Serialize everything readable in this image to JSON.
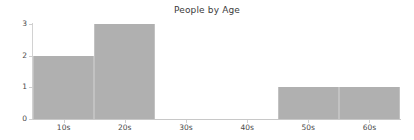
{
  "chart_data": {
    "type": "bar",
    "title": "People by Age",
    "xlabel": "",
    "ylabel": "",
    "categories": [
      "10s",
      "20s",
      "30s",
      "40s",
      "50s",
      "60s"
    ],
    "values": [
      2,
      3,
      0,
      0,
      1,
      1
    ],
    "ytick_labels": [
      "0",
      "1",
      "2",
      "3"
    ],
    "ytick_values": [
      0,
      1,
      2,
      3
    ],
    "ylim": [
      0,
      3
    ],
    "grid": false,
    "legend": null,
    "bar_style": "contiguous-histogram",
    "colors": {
      "bar_fill": "#b0b0b0",
      "bar_edge": "#c2c2c2",
      "axis": "#c8c8c8",
      "text": "#4a4a4a",
      "title_text": "#3a3a3a",
      "background": "#ffffff"
    }
  }
}
